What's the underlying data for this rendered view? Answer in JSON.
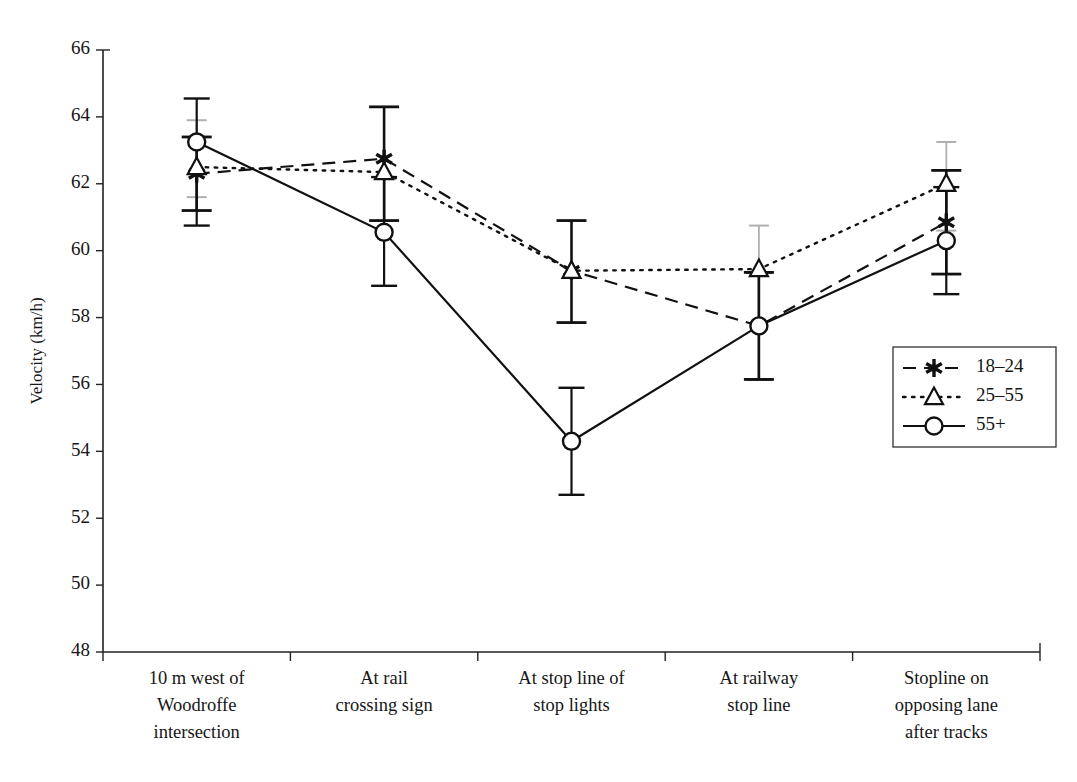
{
  "chart_data": {
    "type": "line",
    "title": "",
    "xlabel": "",
    "ylabel": "Velocity (km/h)",
    "ylim": [
      48,
      66
    ],
    "yticks": [
      48,
      50,
      52,
      54,
      56,
      58,
      60,
      62,
      64,
      66
    ],
    "grid": false,
    "legend_position": "right-middle",
    "categories": [
      "10 m west of Woodroffe intersection",
      "At rail crossing sign",
      "At stop line of stop lights",
      "At railway stop line",
      "Stopline on opposing lane after tracks"
    ],
    "category_label_lines": [
      [
        "10 m west of",
        "Woodroffe",
        "intersection"
      ],
      [
        "At rail",
        "crossing sign"
      ],
      [
        "At stop line of",
        "stop lights"
      ],
      [
        "At railway",
        "stop line"
      ],
      [
        "Stopline on",
        "opposing lane",
        "after tracks"
      ]
    ],
    "series": [
      {
        "name": "18-24",
        "label": "18–24",
        "marker": "star",
        "linestyle": "dashed",
        "color": "#111111",
        "values": [
          62.3,
          62.75,
          59.4,
          57.75,
          60.85
        ],
        "error_low": [
          61.2,
          60.9,
          57.85,
          56.15,
          59.3
        ],
        "error_high": [
          63.4,
          64.3,
          60.9,
          59.35,
          62.4
        ]
      },
      {
        "name": "25-55",
        "label": "25–55",
        "marker": "triangle",
        "linestyle": "dotted",
        "color": "#111111",
        "values": [
          62.5,
          62.35,
          59.4,
          59.45,
          62.0
        ],
        "error_low": [
          61.6,
          63.9,
          59.4,
          56.15,
          60.6
        ],
        "error_high": [
          63.9,
          63.9,
          59.4,
          60.75,
          63.25
        ]
      },
      {
        "name": "55+",
        "label": "55+",
        "marker": "circle",
        "linestyle": "solid",
        "color": "#111111",
        "values": [
          63.25,
          60.55,
          54.3,
          57.75,
          60.3
        ],
        "error_low": [
          60.75,
          58.95,
          52.7,
          56.15,
          58.7
        ],
        "error_high": [
          64.55,
          62.2,
          55.9,
          59.35,
          61.9
        ]
      }
    ]
  },
  "legend": {
    "entries": [
      {
        "label": "18–24",
        "marker": "star",
        "linestyle": "dashed"
      },
      {
        "label": "25–55",
        "marker": "triangle",
        "linestyle": "dotted"
      },
      {
        "label": "55+",
        "marker": "circle",
        "linestyle": "solid"
      }
    ]
  },
  "axis": {
    "y_title": "Velocity (km/h)",
    "y_min": "48",
    "y_max": "66"
  }
}
